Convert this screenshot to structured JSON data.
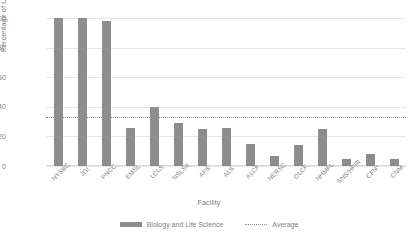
{
  "chart_data": {
    "type": "bar",
    "title": "",
    "xlabel": "Facility",
    "ylabel": "Percentage of Users",
    "ylim": [
      0,
      100
    ],
    "yticks": [
      0,
      20,
      40,
      60,
      80,
      100
    ],
    "grid": true,
    "legend_position": "bottom",
    "categories": [
      "NYSBC",
      "JGI",
      "PNCC",
      "EMSL",
      "LCLS",
      "NSLSII",
      "APS",
      "ALS",
      "ALCF",
      "NERSC",
      "OLCF",
      "NHMFL",
      "SNS/HFIR",
      "CFN*",
      "CNM"
    ],
    "series": [
      {
        "name": "Biology and Life Science",
        "type": "bar",
        "color": "#8d8d8d",
        "values": [
          100,
          100,
          98,
          26,
          40,
          29,
          25,
          26,
          15,
          7,
          14,
          25,
          5,
          8,
          5
        ]
      },
      {
        "name": "Average",
        "type": "line",
        "style": "dotted",
        "color": "#8d8d8d",
        "value": 33
      }
    ]
  },
  "legend": {
    "bar_label": "Biology and Life Science",
    "avg_label": "Average"
  }
}
